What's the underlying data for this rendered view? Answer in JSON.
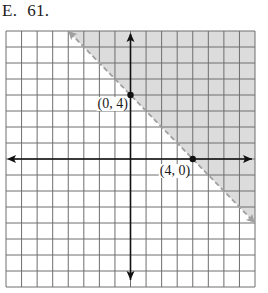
{
  "problem": {
    "letter": "E.",
    "number": "61."
  },
  "graph": {
    "grid": {
      "cols": 16,
      "rows": 16,
      "x_min": -8,
      "x_max": 8,
      "y_min": -8,
      "y_max": 8
    },
    "boundary_line": {
      "equation": "x + y = 4",
      "style": "dashed",
      "from": [
        -4,
        8
      ],
      "to": [
        8,
        -4
      ]
    },
    "shaded_region": "x + y > 4",
    "points": [
      {
        "label": "(0, 4)",
        "x": 0,
        "y": 4
      },
      {
        "label": "(4, 0)",
        "x": 4,
        "y": 0
      }
    ],
    "colors": {
      "grid": "#6e6e6e",
      "axis": "#111111",
      "shade": "#dcdcdc",
      "dashed_line": "#a0a0a0"
    }
  }
}
